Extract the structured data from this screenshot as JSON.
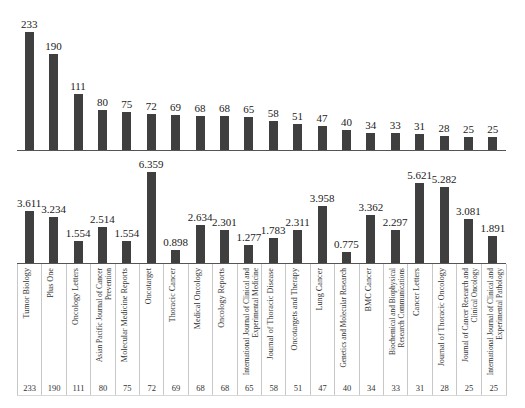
{
  "chart_data": [
    {
      "type": "bar",
      "title": "",
      "xlabel": "",
      "ylabel": "",
      "categories": [
        "Tumor Biology",
        "Plus One",
        "Oncology Letters",
        "Asian Pacific Journal of Cancer Prevention",
        "Molecular Medicine Reports",
        "Oncotarget",
        "Thoracic Cancer",
        "Medical Oncology",
        "Oncology Reports",
        "International Journal of Clinical and Experimental Medicine",
        "Journal of Thoracic Disease",
        "Oncotargets and Therapy",
        "Lung Cancer",
        "Genetics and Molecular Research",
        "BMC Cancer",
        "Biochemical and Biophysical Research Communications",
        "Cancer Letters",
        "Journal of Thoracic Oncology",
        "Journal of Cancer Research and Clinical Oncology",
        "International Journal of Clinical and Experimental Pathology"
      ],
      "values": [
        233,
        190,
        111,
        80,
        75,
        72,
        69,
        68,
        68,
        65,
        58,
        51,
        47,
        40,
        34,
        33,
        31,
        28,
        25,
        25
      ],
      "value_labels": [
        "233",
        "190",
        "111",
        "80",
        "75",
        "72",
        "69",
        "68",
        "68",
        "65",
        "58",
        "51",
        "47",
        "40",
        "34",
        "33",
        "31",
        "28",
        "25",
        "25"
      ],
      "ylim": [
        0,
        240
      ],
      "grid": false,
      "legend": "none"
    },
    {
      "type": "bar",
      "title": "",
      "xlabel": "",
      "ylabel": "",
      "categories": [
        "Tumor Biology",
        "Plus One",
        "Oncology Letters",
        "Asian Pacific Journal of Cancer Prevention",
        "Molecular Medicine Reports",
        "Oncotarget",
        "Thoracic Cancer",
        "Medical Oncology",
        "Oncology Reports",
        "International Journal of Clinical and Experimental Medicine",
        "Journal of Thoracic Disease",
        "Oncotargets and Therapy",
        "Lung Cancer",
        "Genetics and Molecular Research",
        "BMC Cancer",
        "Biochemical and Biophysical Research Communications",
        "Cancer Letters",
        "Journal of Thoracic Oncology",
        "Journal of Cancer Research and Clinical Oncology",
        "International Journal of Clinical and Experimental Pathology"
      ],
      "values": [
        3.611,
        3.234,
        1.554,
        2.514,
        1.554,
        6.359,
        0.898,
        2.634,
        2.301,
        1.277,
        1.783,
        2.311,
        3.958,
        0.775,
        3.362,
        2.297,
        5.621,
        5.282,
        3.081,
        1.891
      ],
      "value_labels": [
        "3.611",
        "3.234",
        "1.554",
        "2.514",
        "1.554",
        "6.359",
        "0.898",
        "2.634",
        "2.301",
        "1.277",
        "1.783",
        "2.311",
        "3.958",
        "0.775",
        "3.362",
        "2.297",
        "5.621",
        "5.282",
        "3.081",
        "1.891"
      ],
      "ylim": [
        0,
        6.5
      ],
      "grid": false,
      "legend": "none"
    }
  ],
  "table": {
    "rows": [
      {
        "name": "Tumor Biology",
        "count": "233"
      },
      {
        "name": "Plus One",
        "count": "190"
      },
      {
        "name": "Oncology Letters",
        "count": "111"
      },
      {
        "name": "Asian Pacific Journal of Cancer Prevention",
        "count": "80"
      },
      {
        "name": "Molecular Medicine Reports",
        "count": "75"
      },
      {
        "name": "Oncotarget",
        "count": "72"
      },
      {
        "name": "Thoracic Cancer",
        "count": "69"
      },
      {
        "name": "Medical Oncology",
        "count": "68"
      },
      {
        "name": "Oncology Reports",
        "count": "68"
      },
      {
        "name": "International Journal of Clinical and Experimental Medicine",
        "count": "65"
      },
      {
        "name": "Journal of Thoracic Disease",
        "count": "58"
      },
      {
        "name": "Oncotargets and Therapy",
        "count": "51"
      },
      {
        "name": "Lung Cancer",
        "count": "47"
      },
      {
        "name": "Genetics and Molecular Research",
        "count": "40"
      },
      {
        "name": "BMC Cancer",
        "count": "34"
      },
      {
        "name": "Biochemical and Biophysical Research Communications",
        "count": "33"
      },
      {
        "name": "Cancer Letters",
        "count": "31"
      },
      {
        "name": "Journal of Thoracic Oncology",
        "count": "28"
      },
      {
        "name": "Journal of Cancer Research and Clinical Oncology",
        "count": "25"
      },
      {
        "name": "International Journal of Clinical and Experimental Pathology",
        "count": "25"
      }
    ]
  },
  "colors": {
    "bar": "#3f3f3f",
    "axis": "#555555",
    "grid_border": "#c8c8c8"
  }
}
